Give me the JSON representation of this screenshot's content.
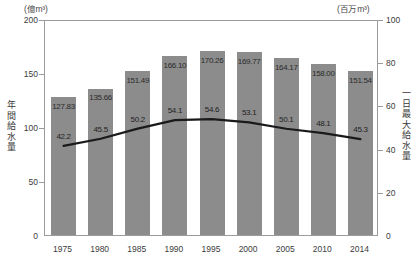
{
  "chart_data": {
    "type": "bar",
    "title": "",
    "xlabel": "",
    "categories": [
      "1975",
      "1980",
      "1985",
      "1990",
      "1995",
      "2000",
      "2005",
      "2010",
      "2014"
    ],
    "grid": false,
    "legend": "none",
    "series": [
      {
        "name": "年間給水量",
        "type": "bar",
        "axis": "left",
        "unit": "(億m³)",
        "ylabel": "年間給水量",
        "ylim": [
          0,
          200
        ],
        "yticks": [
          0,
          50,
          100,
          150,
          200
        ],
        "color": "#8c8c8c",
        "values": [
          127.83,
          135.66,
          151.49,
          166.1,
          170.26,
          169.77,
          164.17,
          158.0,
          151.54
        ],
        "value_labels": [
          "127.83",
          "135.66",
          "151.49",
          "166.10",
          "170.26",
          "169.77",
          "164.17",
          "158.00",
          "151.54"
        ]
      },
      {
        "name": "一日最大給水量",
        "type": "line",
        "axis": "right",
        "unit": "(百万m³)",
        "ylabel": "一日最大給水量",
        "ylim": [
          0,
          100
        ],
        "yticks": [
          0,
          20,
          40,
          60,
          80,
          100
        ],
        "color": "#1a1a1a",
        "values": [
          42.2,
          45.5,
          50.2,
          54.1,
          54.6,
          53.1,
          50.1,
          48.1,
          45.3
        ],
        "value_labels": [
          "42.2",
          "45.5",
          "50.2",
          "54.1",
          "54.6",
          "53.1",
          "50.1",
          "48.1",
          "45.3"
        ]
      }
    ]
  },
  "axes": {
    "left": {
      "unit_caption": "(億m³)",
      "title": "年間給水量",
      "ticks": [
        "200",
        "150",
        "100",
        "50",
        "0"
      ]
    },
    "right": {
      "unit_caption": "(百万m³)",
      "title": "一日最大給水量",
      "ticks": [
        "100",
        "80",
        "60",
        "40",
        "20",
        "0"
      ]
    },
    "x": {
      "ticks": [
        "1975",
        "1980",
        "1985",
        "1990",
        "1995",
        "2000",
        "2005",
        "2010",
        "2014"
      ]
    }
  }
}
